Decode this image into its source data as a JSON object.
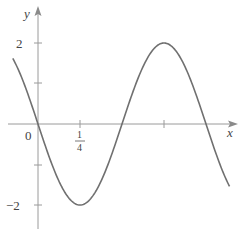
{
  "chart_data": {
    "type": "line",
    "title": "",
    "function": "y = -2 sin(2πx)",
    "xlabel": "x",
    "ylabel": "y",
    "xlim": [
      -0.15,
      1.14
    ],
    "ylim": [
      -2.6,
      2.6
    ],
    "grid": false,
    "legend": null,
    "x_ticks": [
      {
        "value": 0,
        "label": "0"
      },
      {
        "value": 0.25,
        "label": "1/4",
        "numerator": "1",
        "denominator": "4"
      },
      {
        "value": 0.5,
        "label": ""
      },
      {
        "value": 0.75,
        "label": ""
      },
      {
        "value": 1,
        "label": ""
      }
    ],
    "y_ticks": [
      {
        "value": 2,
        "label": "2"
      },
      {
        "value": 1,
        "label": ""
      },
      {
        "value": -1,
        "label": ""
      },
      {
        "value": -2,
        "label": "−2"
      }
    ],
    "key_points": [
      {
        "x": -0.15,
        "y": 1.62
      },
      {
        "x": 0,
        "y": 0
      },
      {
        "x": 0.25,
        "y": -2
      },
      {
        "x": 0.5,
        "y": 0
      },
      {
        "x": 0.75,
        "y": 2
      },
      {
        "x": 1,
        "y": 0
      },
      {
        "x": 1.14,
        "y": -1.54
      }
    ],
    "series": [
      {
        "name": "y = -2 sin(2πx)",
        "color": "#707070"
      }
    ]
  },
  "labels": {
    "origin": "0",
    "x_axis": "x",
    "y_axis": "y",
    "y_tick_pos": "2",
    "y_tick_neg": "−2",
    "x_tick_num": "1",
    "x_tick_den": "4"
  },
  "colors": {
    "curve": "#707070",
    "axes": "#9a9a9a",
    "text": "#444444"
  }
}
